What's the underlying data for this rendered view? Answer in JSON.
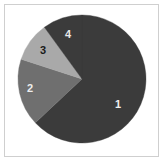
{
  "figure": {
    "background_color": "#ffffff",
    "border_color": "#cfcfcf"
  },
  "chart_data": {
    "type": "pie",
    "title": "",
    "subtitle": "",
    "xlabel": "",
    "ylabel": "",
    "grid": false,
    "legend_position": "none",
    "labels_inside_slices": true,
    "start_angle_deg": 0,
    "direction": "clockwise",
    "center": {
      "x": 82,
      "y": 79
    },
    "radius": 64,
    "categories": [
      "1",
      "2",
      "3",
      "4"
    ],
    "values": [
      63,
      17,
      10,
      10
    ],
    "percentages": [
      63,
      17,
      10,
      10
    ],
    "slices": [
      {
        "label": "1",
        "value": 63,
        "percent": 63,
        "start_angle_deg": 0,
        "end_angle_deg": 226.8,
        "color": "#3b3b3b",
        "label_color": "#f0f0f0",
        "label_x": 118,
        "label_y": 104
      },
      {
        "label": "2",
        "value": 17,
        "percent": 17,
        "start_angle_deg": 226.8,
        "end_angle_deg": 288.0,
        "color": "#6f6f6f",
        "label_color": "#ededed",
        "label_x": 30,
        "label_y": 88
      },
      {
        "label": "3",
        "value": 10,
        "percent": 10,
        "start_angle_deg": 288.0,
        "end_angle_deg": 324.0,
        "color": "#a9a9a9",
        "label_color": "#1a1a1a",
        "label_x": 43,
        "label_y": 50
      },
      {
        "label": "4",
        "value": 10,
        "percent": 10,
        "start_angle_deg": 324.0,
        "end_angle_deg": 360.0,
        "color": "#3b3b3b",
        "label_color": "#e8e8e8",
        "label_x": 68,
        "label_y": 34
      }
    ]
  }
}
